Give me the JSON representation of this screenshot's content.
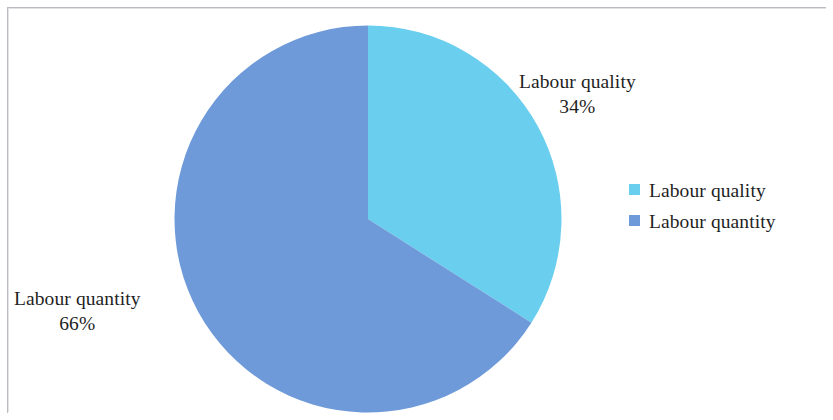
{
  "chart_data": {
    "type": "pie",
    "title": "",
    "subtitle": "",
    "xlabel": "",
    "ylabel": "",
    "categories": [
      "Labour quality",
      "Labour quantity"
    ],
    "values": [
      34,
      66
    ],
    "value_unit": "%",
    "colors": [
      "#6ACEEE",
      "#6E9AD9"
    ],
    "legend_position": "right",
    "grid": false,
    "start_angle_deg": 0,
    "direction": "clockwise",
    "slices": [
      {
        "label": "Labour quality",
        "value": 34,
        "display_value": "34%",
        "color": "#6ACEEE",
        "start_angle_deg": 0,
        "sweep_deg": 122.4
      },
      {
        "label": "Labour quantity",
        "value": 66,
        "display_value": "66%",
        "color": "#6E9AD9",
        "start_angle_deg": 122.4,
        "sweep_deg": 237.6
      }
    ],
    "annotations": [
      {
        "name": "callout-quality",
        "category": "Labour quality",
        "percent": "34%"
      },
      {
        "name": "callout-quantity",
        "category": "Labour quantity",
        "percent": "66%"
      }
    ]
  },
  "callouts": {
    "quality": {
      "category": "Labour quality",
      "percent": "34%"
    },
    "quantity": {
      "category": "Labour quantity",
      "percent": "66%"
    }
  },
  "legend": {
    "items": [
      {
        "label": "Labour quality",
        "color": "#6ACEEE"
      },
      {
        "label": "Labour quantity",
        "color": "#6E9AD9"
      }
    ]
  },
  "palette": {
    "background": "#ffffff",
    "text": "#1f1f1f",
    "frame": "#b9bcc0",
    "slice_light": "#6ACEEE",
    "slice_dark": "#6E9AD9"
  }
}
